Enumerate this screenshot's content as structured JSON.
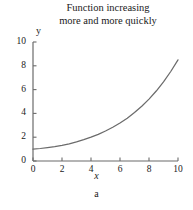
{
  "chart_data": {
    "type": "line",
    "title_line1": "Function increasing",
    "title_line2": "more and more quickly",
    "xlabel": "x",
    "ylabel": "y",
    "caption": "a",
    "xlim": [
      0,
      10
    ],
    "ylim": [
      0,
      10
    ],
    "grid": false,
    "legend": null,
    "xticks": [
      0,
      2,
      4,
      6,
      8,
      10
    ],
    "xtick_labels": [
      "0",
      "2",
      "4",
      "6",
      "8",
      "10"
    ],
    "yticks": [
      0,
      2,
      4,
      6,
      8,
      10
    ],
    "ytick_labels": [
      "0",
      "2",
      "4",
      "6",
      "8",
      "10"
    ],
    "line_color": "#6b6b6b",
    "series": [
      {
        "name": "increasing function",
        "x": [
          0,
          0.5,
          1,
          1.5,
          2,
          2.5,
          3,
          3.5,
          4,
          4.5,
          5,
          5.5,
          6,
          6.5,
          7,
          7.5,
          8,
          8.5,
          9,
          9.5,
          10
        ],
        "y": [
          1.0,
          1.05,
          1.12,
          1.2,
          1.31,
          1.44,
          1.6,
          1.79,
          2.0,
          2.24,
          2.52,
          2.84,
          3.2,
          3.6,
          4.07,
          4.6,
          5.2,
          5.88,
          6.65,
          7.52,
          8.5
        ]
      }
    ]
  },
  "axis": {
    "y_label": "y",
    "x_label": "x",
    "caption": "a"
  }
}
